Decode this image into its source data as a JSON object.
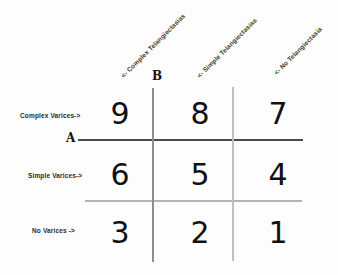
{
  "diagram": {
    "axes": {
      "a_label": "A",
      "b_label": "B"
    },
    "row_labels": [
      "Complex Varices->",
      "Simple Varices->",
      "No Varices ->"
    ],
    "column_labels": [
      "<- Complex Telangiectasias",
      "<- Simple Telangiectasias",
      "<- No Telangiectasia"
    ],
    "cells": [
      [
        "9",
        "8",
        "7"
      ],
      [
        "6",
        "5",
        "4"
      ],
      [
        "3",
        "2",
        "1"
      ]
    ],
    "colors": {
      "line_dark": "#4a4a4a",
      "line_medium": "#8f8f8f",
      "line_light": "#b4b4b4",
      "line_lighter": "#c0c0c0",
      "text": "#111111",
      "background": "#fdfdfd"
    }
  }
}
